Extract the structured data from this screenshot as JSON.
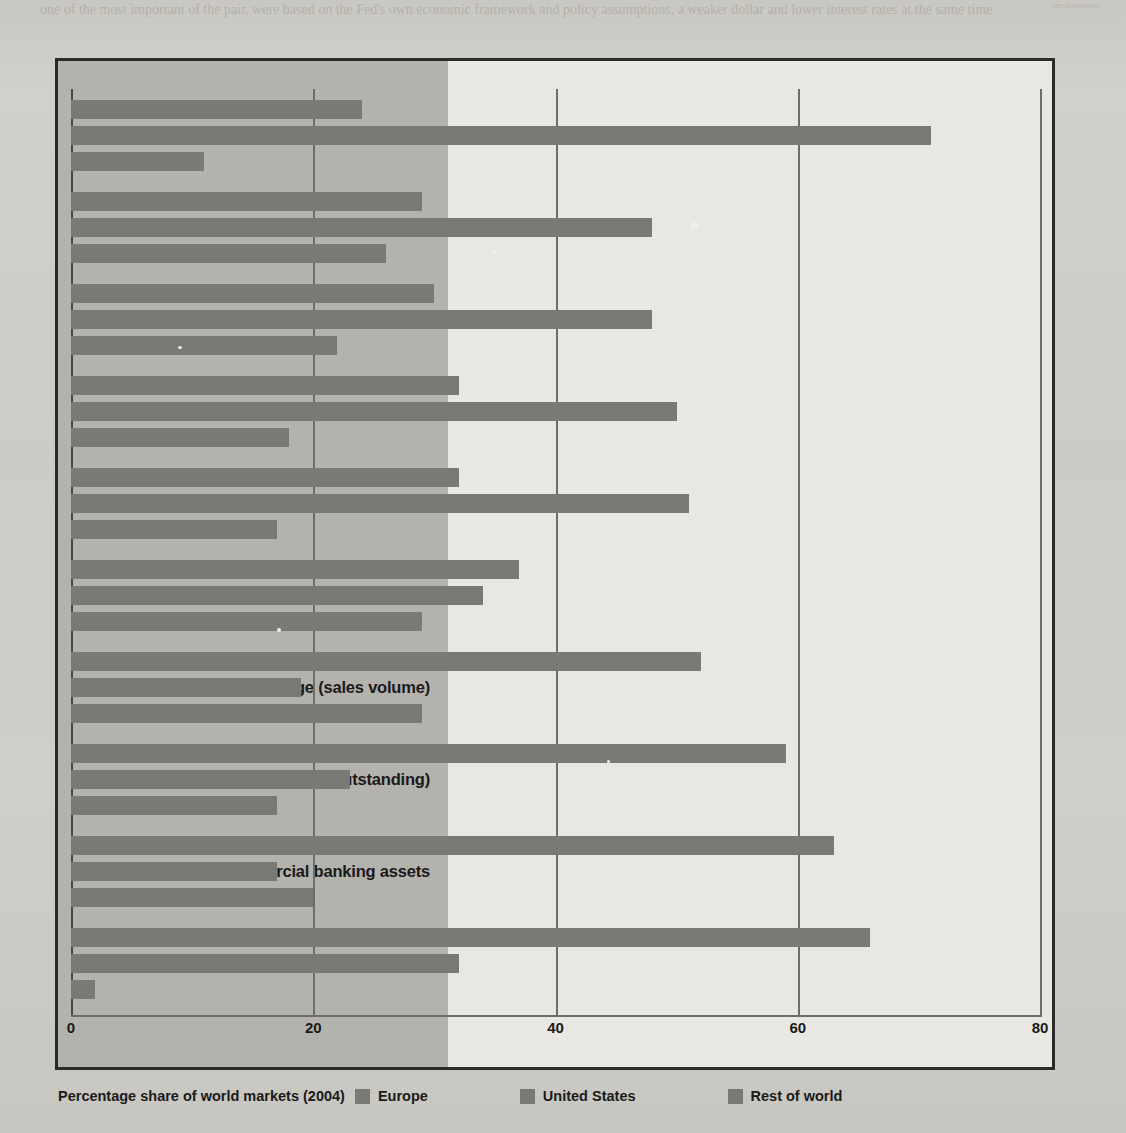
{
  "chart_data": {
    "type": "bar",
    "orientation": "horizontal",
    "title": "Percentage share of world markets (2004)",
    "xlabel": "",
    "ylabel": "",
    "xlim": [
      0,
      80
    ],
    "xticks": [
      0,
      20,
      40,
      60,
      80
    ],
    "xtick_labels": [
      "0",
      "20",
      "40",
      "60",
      "80"
    ],
    "grid": true,
    "legend_position": "bottom",
    "categories": [
      "Hedge fund assets under management",
      "Investment banking revenue",
      "Domestic bonds (outstanding)",
      "Equity market (sales volume)",
      "Equity funds under management",
      "Insurance (volume of premiums)",
      "Foreign exchange (sales volume)",
      "International bonds (outstanding)",
      "Commercial banking assets",
      "Foreign equity trading"
    ],
    "series": [
      {
        "name": "Europe",
        "color": "#7b7974",
        "values": [
          24,
          29,
          30,
          32,
          32,
          37,
          52,
          59,
          63,
          66
        ]
      },
      {
        "name": "United States",
        "color": "#7b7974",
        "values": [
          71,
          48,
          48,
          50,
          51,
          34,
          19,
          23,
          17,
          32
        ]
      },
      {
        "name": "Rest of world",
        "color": "#7b7974",
        "values": [
          11,
          26,
          22,
          18,
          17,
          29,
          29,
          17,
          20,
          2
        ]
      }
    ]
  },
  "legend": {
    "title": "Percentage share of world markets (2004)",
    "items": [
      {
        "label": "Europe"
      },
      {
        "label": "United States"
      },
      {
        "label": "Rest of world"
      }
    ]
  },
  "background": {
    "top_text": "one of the most important of the pair, were based on the Fed's own economic framework and policy assumptions, a weaker dollar and lower interest rates at the same time",
    "side_text": "THE ECONOMIST"
  }
}
